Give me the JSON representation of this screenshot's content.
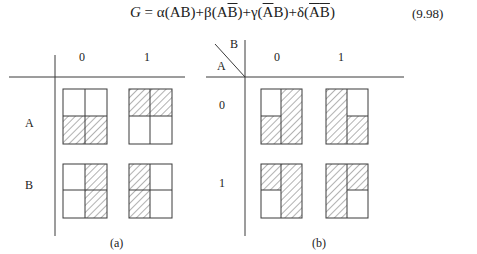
{
  "equation": {
    "lhs": "G",
    "eq": " = ",
    "terms": [
      {
        "coef": "α",
        "expr_pre": "(",
        "a": "A",
        "a_bar": false,
        "b": "B",
        "b_bar": false,
        "all_bar": false,
        "expr_post": ")"
      },
      {
        "coef": "β",
        "a": "A",
        "a_bar": false,
        "b": "B",
        "b_bar": true,
        "all_bar": false
      },
      {
        "coef": "γ",
        "a": "A",
        "a_bar": true,
        "b": "B",
        "b_bar": false,
        "all_bar": false
      },
      {
        "coef": "δ",
        "a": "A",
        "b": "B",
        "all_bar": true
      }
    ],
    "plus": "+",
    "number": "(9.98)"
  },
  "diagram_a": {
    "caption": "(a)",
    "col_labels": [
      "0",
      "1"
    ],
    "row_labels": [
      "A",
      "B"
    ],
    "cells": [
      {
        "row": "A",
        "col": "0",
        "hatched": [
          "bottom-left",
          "bottom-right"
        ]
      },
      {
        "row": "A",
        "col": "1",
        "hatched": [
          "top-left",
          "top-right"
        ]
      },
      {
        "row": "B",
        "col": "0",
        "hatched": [
          "top-right",
          "bottom-right"
        ]
      },
      {
        "row": "B",
        "col": "1",
        "hatched": [
          "top-left",
          "bottom-left"
        ]
      }
    ]
  },
  "diagram_b": {
    "caption": "(b)",
    "corner_row_var": "A",
    "corner_col_var": "B",
    "col_labels": [
      "0",
      "1"
    ],
    "row_labels": [
      "0",
      "1"
    ],
    "cells": [
      {
        "row": "0",
        "col": "0",
        "hatched": [
          "bottom-left",
          "top-right",
          "bottom-right"
        ]
      },
      {
        "row": "0",
        "col": "1",
        "hatched": [
          "top-left",
          "bottom-left",
          "bottom-right"
        ]
      },
      {
        "row": "1",
        "col": "0",
        "hatched": [
          "top-left",
          "top-right",
          "bottom-right"
        ]
      },
      {
        "row": "1",
        "col": "1",
        "hatched": [
          "top-left",
          "bottom-left",
          "top-right"
        ]
      }
    ]
  },
  "colors": {
    "line": "#3a3a3a",
    "hatch": "#555555",
    "background": "#ffffff"
  }
}
